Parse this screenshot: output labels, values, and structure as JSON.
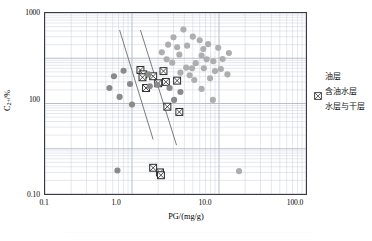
{
  "chart_data": {
    "type": "scatter",
    "title": "",
    "xlabel": "PG/(mg/g)",
    "ylabel_html": "C2+/%",
    "xscale": "log",
    "yscale": "log",
    "xlim": [
      0.1,
      100.0
    ],
    "ylim": [
      0.1,
      1000
    ],
    "grid": true,
    "grid_minor": true,
    "legend_position": "right",
    "xticks": [
      "0.1",
      "1.0",
      "10.0",
      "100.0"
    ],
    "xtick_values": [
      0.1,
      1.0,
      10.0,
      100.0
    ],
    "yticks": [
      "1000",
      "100",
      "0.10"
    ],
    "ytick_values": [
      1000,
      100,
      0.1
    ],
    "series": [
      {
        "name": "油层",
        "marker": "circle",
        "color": "#aeaeae",
        "points": [
          [
            3.9,
            430
          ],
          [
            2.6,
            200
          ],
          [
            5.0,
            300
          ],
          [
            3.3,
            175
          ],
          [
            4.3,
            190
          ],
          [
            6.0,
            250
          ],
          [
            7.5,
            205
          ],
          [
            6.6,
            160
          ],
          [
            3.5,
            120
          ],
          [
            6.3,
            115
          ],
          [
            7.2,
            95
          ],
          [
            2.5,
            95
          ],
          [
            2.9,
            80
          ],
          [
            5.4,
            78
          ],
          [
            8.6,
            86
          ],
          [
            4.2,
            62
          ],
          [
            6.7,
            60
          ],
          [
            9.0,
            52
          ],
          [
            3.6,
            48
          ],
          [
            4.6,
            42
          ],
          [
            5.2,
            33
          ],
          [
            6.3,
            21
          ],
          [
            8.5,
            12
          ],
          [
            11.0,
            96
          ],
          [
            13.0,
            130
          ],
          [
            10.5,
            58
          ],
          [
            12.5,
            44
          ],
          [
            9.8,
            170
          ],
          [
            2.2,
            135
          ],
          [
            3.0,
            290
          ],
          [
            4.9,
            60
          ],
          [
            7.9,
            36
          ],
          [
            17.0,
            0.32
          ]
        ]
      },
      {
        "name": "含油水层",
        "marker": "square-x",
        "color": "#2b2b2b",
        "points": [
          [
            1.25,
            55
          ],
          [
            1.35,
            44
          ],
          [
            1.32,
            38
          ],
          [
            1.75,
            40
          ],
          [
            2.3,
            52
          ],
          [
            2.0,
            28
          ],
          [
            2.45,
            30
          ],
          [
            3.3,
            32
          ],
          [
            2.55,
            8.5
          ],
          [
            3.5,
            6.5
          ],
          [
            1.75,
            0.38
          ],
          [
            2.1,
            0.3
          ],
          [
            2.15,
            0.26
          ],
          [
            1.45,
            22
          ]
        ]
      },
      {
        "name": "水层与干层",
        "marker": "circle",
        "color": "#8a8a8a",
        "points": [
          [
            0.8,
            53
          ],
          [
            0.62,
            40
          ],
          [
            0.55,
            22
          ],
          [
            0.95,
            27
          ],
          [
            0.72,
            14
          ],
          [
            1.0,
            9.5
          ],
          [
            1.55,
            44
          ],
          [
            1.6,
            24
          ],
          [
            1.95,
            26
          ],
          [
            2.7,
            22
          ],
          [
            3.6,
            18
          ],
          [
            0.68,
            0.33
          ],
          [
            3.05,
            12
          ]
        ]
      }
    ],
    "trend_lines": [
      {
        "name": "upper-boundary-line",
        "x1": 0.72,
        "y1": 420,
        "x2": 1.75,
        "y2": 1.6
      },
      {
        "name": "lower-boundary-line",
        "x1": 1.25,
        "y1": 420,
        "x2": 3.25,
        "y2": 1.2
      }
    ]
  },
  "legend": {
    "items": [
      {
        "label": "油层",
        "marker": "circle",
        "color": "#b2b2b2"
      },
      {
        "label": "含油水层",
        "marker": "square-x",
        "color": "#2b2b2b"
      },
      {
        "label": "水层与干层",
        "marker": "circle",
        "color": "#808080"
      }
    ]
  },
  "axes": {
    "x_title": "PG/(mg/g)",
    "y_title_main": "C",
    "y_title_sub": "2+",
    "y_title_tail": "/%",
    "x_ticks": [
      "0.1",
      "1.0",
      "10.0",
      "100.0"
    ],
    "y_ticks": [
      "1000",
      "100",
      "0.10"
    ]
  }
}
